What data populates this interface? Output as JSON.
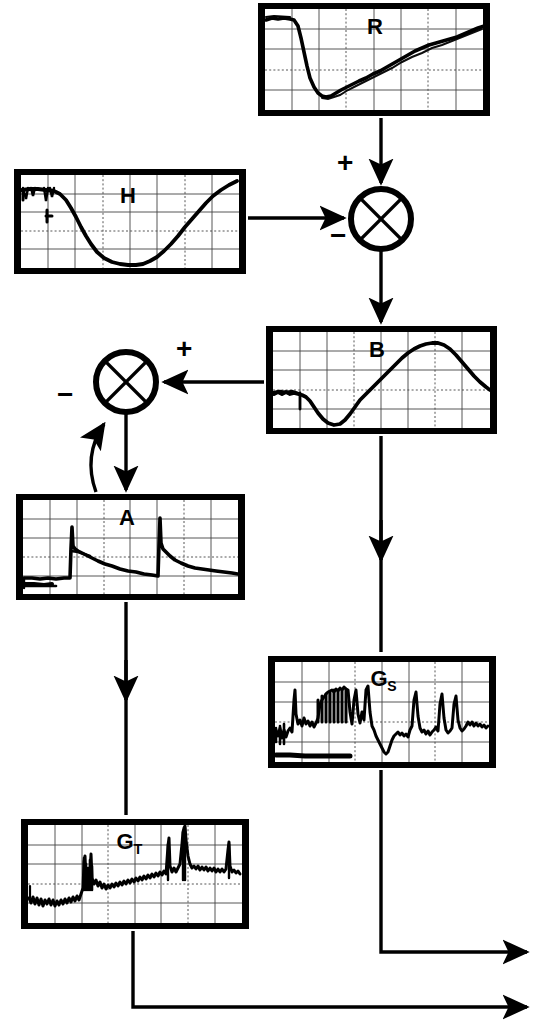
{
  "figure": {
    "type": "block-diagram",
    "background_color": "#ffffff",
    "ink_color": "#000000"
  },
  "scopes": [
    {
      "id": "R",
      "label": "R",
      "subscript": "",
      "x": 258,
      "y": 3,
      "w": 232,
      "h": 113,
      "grid_cols": 8,
      "grid_rows": 5,
      "label_x": 375,
      "label_y": 22,
      "trace": "flat high plateau at left, sharp drop to deep minimum at ~1/4, then slow noisy rise to right edge"
    },
    {
      "id": "H",
      "label": "H",
      "subscript": "",
      "x": 14,
      "y": 169,
      "w": 232,
      "h": 105,
      "grid_cols": 8,
      "grid_rows": 5,
      "label_x": 128,
      "label_y": 190,
      "trace": "flat high plateau at left with notches, smooth descent to broad minimum near centre-right, then rise to right edge"
    },
    {
      "id": "B",
      "label": "B",
      "subscript": "",
      "x": 266,
      "y": 326,
      "w": 231,
      "h": 108,
      "grid_cols": 8,
      "grid_rows": 5,
      "label_x": 377,
      "label_y": 345,
      "trace": "low noisy plateau left, dip to minimum at ~1/3, steep rise to peak at ~3/4, then fall to right edge"
    },
    {
      "id": "A",
      "label": "A",
      "subscript": "",
      "x": 16,
      "y": 494,
      "w": 229,
      "h": 106,
      "grid_cols": 8,
      "grid_rows": 5,
      "label_x": 127,
      "label_y": 513,
      "trace": "flat baseline, sharp spike at ~1/5 then exponential decay, second sharp spike at ~3/5 then decay to baseline"
    },
    {
      "id": "GS",
      "label": "G",
      "subscript": "S",
      "x": 268,
      "y": 656,
      "w": 228,
      "h": 112,
      "grid_cols": 8,
      "grid_rows": 5,
      "label_x": 385,
      "label_y": 674,
      "trace": "noisy band with dense spike cluster in left half, deep notch at centre, isolated spikes in right half"
    },
    {
      "id": "GT",
      "label": "G",
      "subscript": "T",
      "x": 21,
      "y": 819,
      "w": 228,
      "h": 110,
      "grid_cols": 8,
      "grid_rows": 5,
      "label_x": 131,
      "label_y": 838,
      "trace": "low noisy baseline left, tall spike at ~1/4, noisy mid band, tall spike pair at ~2/3, single spike near right edge"
    }
  ],
  "junctions": [
    {
      "id": "sum-1",
      "cx": 381,
      "cy": 219,
      "r": 31,
      "signs": [
        {
          "symbol": "+",
          "x": 343,
          "y": 158
        },
        {
          "symbol": "−",
          "x": 335,
          "y": 230
        }
      ]
    },
    {
      "id": "sum-2",
      "cx": 126,
      "cy": 382,
      "r": 31,
      "signs": [
        {
          "symbol": "+",
          "x": 181,
          "y": 343
        },
        {
          "symbol": "−",
          "x": 62,
          "y": 390
        }
      ]
    }
  ],
  "connectors": [
    {
      "id": "r-to-sum1",
      "from": "R",
      "to": "sum-1",
      "kind": "arrow-down"
    },
    {
      "id": "h-to-sum1",
      "from": "H",
      "to": "sum-1",
      "kind": "arrow-right"
    },
    {
      "id": "sum1-to-b",
      "from": "sum-1",
      "to": "B",
      "kind": "arrow-down"
    },
    {
      "id": "b-to-sum2",
      "from": "B",
      "to": "sum-2",
      "kind": "arrow-left"
    },
    {
      "id": "sum2-to-a",
      "from": "sum-2",
      "to": "A",
      "kind": "arrow-down"
    },
    {
      "id": "a-to-sum2",
      "from": "A",
      "to": "sum-2",
      "kind": "curved-feedback-arrow-up"
    },
    {
      "id": "b-to-gs",
      "from": "B",
      "to": "GS",
      "kind": "arrow-down-long"
    },
    {
      "id": "a-to-gt",
      "from": "A",
      "to": "GT",
      "kind": "arrow-down-long"
    },
    {
      "id": "gs-output",
      "from": "GS",
      "to": "output",
      "kind": "elbow-arrow-right"
    },
    {
      "id": "gt-output",
      "from": "GT",
      "to": "output",
      "kind": "elbow-arrow-right"
    }
  ]
}
